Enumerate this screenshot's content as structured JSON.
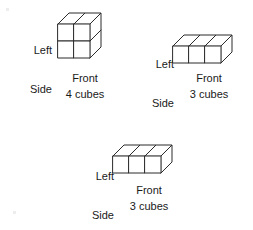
{
  "page": {
    "background_color": "#ffffff",
    "line_color": "#2b2b2b",
    "text_color": "#1a1a1a",
    "width": 253,
    "height": 230
  },
  "figures": [
    {
      "id": "figure-1",
      "side_label_line1": "Left",
      "side_label_line2": "Side",
      "front_label": "Front",
      "count_label": "4 cubes",
      "cube_count": 4,
      "arrangement": "2 wide x 2 tall x 1 deep",
      "columns": 2,
      "rows": 2
    },
    {
      "id": "figure-2",
      "side_label_line1": "Left",
      "side_label_line2": "Side",
      "front_label": "Front",
      "count_label": "3 cubes",
      "cube_count": 3,
      "arrangement": "3 wide x 1 tall x 1 deep",
      "columns": 3,
      "rows": 1
    },
    {
      "id": "figure-3",
      "side_label_line1": "Left",
      "side_label_line2": "Side",
      "front_label": "Front",
      "count_label": "3 cubes",
      "cube_count": 3,
      "arrangement": "3 wide x 1 tall x 1 deep",
      "columns": 3,
      "rows": 1
    }
  ]
}
